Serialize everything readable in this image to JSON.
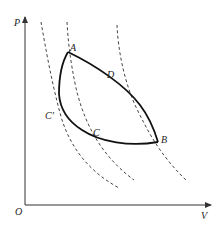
{
  "diagram": {
    "type": "P-V diagram",
    "axes": {
      "y_label": "P",
      "x_label": "V",
      "origin_label": "O"
    },
    "points": [
      {
        "id": "A",
        "label": "A"
      },
      {
        "id": "D",
        "label": "D"
      },
      {
        "id": "B",
        "label": "B"
      },
      {
        "id": "C",
        "label": "C"
      },
      {
        "id": "C_prime",
        "label": "C'"
      }
    ],
    "curves": {
      "solid": [
        "A-D-B upper process curve",
        "B-C-C'-A lower process curve"
      ],
      "dashed": [
        "isotherm through C'",
        "isotherm through A and C",
        "isotherm through D and B"
      ]
    },
    "colors": {
      "line": "#111111",
      "dashed": "#444444",
      "background": "#ffffff"
    }
  }
}
